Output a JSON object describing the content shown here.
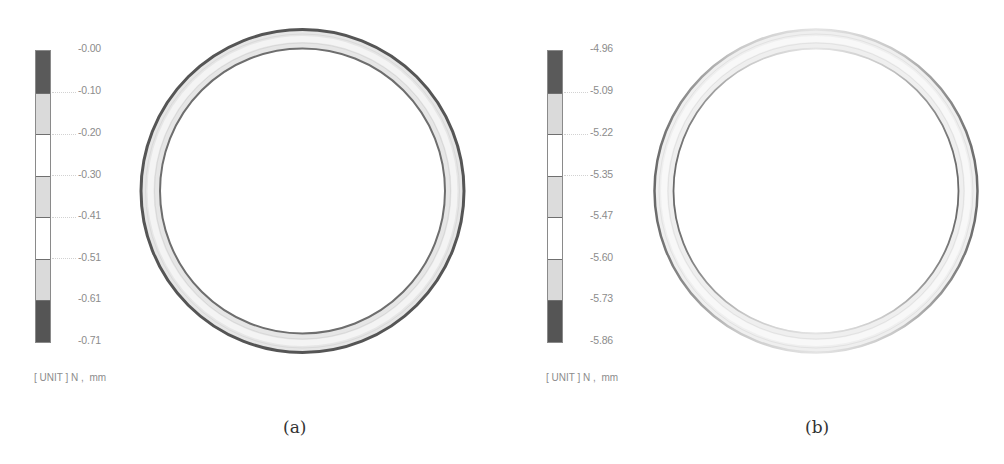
{
  "panels": [
    {
      "id": "a",
      "caption": "(a)",
      "legend": {
        "labels": [
          "-0.00",
          "-0.10",
          "-0.20",
          "-0.30",
          "-0.41",
          "-0.51",
          "-0.61",
          "-0.71"
        ],
        "segment_colors": [
          "#5a5a5a",
          "#dadada",
          "#ffffff",
          "#dcdcdc",
          "#ffffff",
          "#dadada",
          "#555555"
        ],
        "unit": "[ UNIT ] N ,  mm"
      },
      "ring": {
        "outer_edge_color": "#555555",
        "inner_edge_color": "#777777",
        "band_color": "#e9e9e9"
      }
    },
    {
      "id": "b",
      "caption": "(b)",
      "legend": {
        "labels": [
          "-4.96",
          "-5.09",
          "-5.22",
          "-5.35",
          "-5.47",
          "-5.60",
          "-5.73",
          "-5.86"
        ],
        "segment_colors": [
          "#5a5a5a",
          "#dadada",
          "#ffffff",
          "#dcdcdc",
          "#ffffff",
          "#dadada",
          "#555555"
        ],
        "unit": "[ UNIT ] N ,  mm"
      },
      "ring": {
        "outer_edge_color": "#9a9a9a",
        "inner_edge_color": "#a8a8a8",
        "band_color": "#f0f0f0"
      }
    }
  ]
}
